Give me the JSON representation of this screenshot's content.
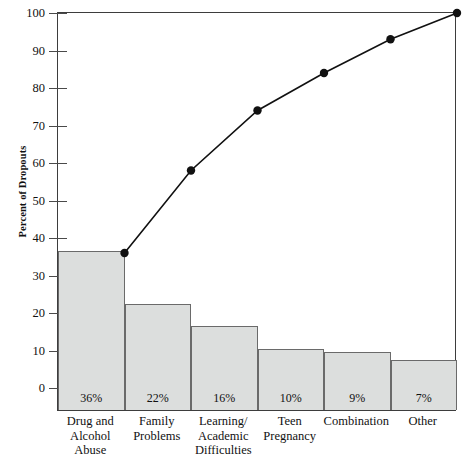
{
  "chart_data": {
    "type": "bar",
    "title": "",
    "xlabel": "",
    "ylabel": "Percent of Dropouts",
    "ylim": [
      0,
      100
    ],
    "yticks": [
      0,
      10,
      20,
      30,
      40,
      50,
      60,
      70,
      80,
      90,
      100
    ],
    "grid": false,
    "legend": "none",
    "categories": [
      "Drug and Alcohol Abuse",
      "Family Problems",
      "Learning/ Academic Difficulties",
      "Teen Pregnancy",
      "Combination",
      "Other"
    ],
    "category_lines": [
      [
        "Drug and",
        "Alcohol",
        "Abuse"
      ],
      [
        "Family",
        "Problems"
      ],
      [
        "Learning/",
        "Academic",
        "Difficulties"
      ],
      [
        "Teen",
        "Pregnancy"
      ],
      [
        "Combination"
      ],
      [
        "Other"
      ]
    ],
    "values": [
      36,
      22,
      16,
      10,
      9,
      7
    ],
    "bar_labels": [
      "36%",
      "22%",
      "16%",
      "10%",
      "9%",
      "7%"
    ],
    "series": [
      {
        "name": "Percent of Dropouts",
        "type": "bar",
        "values": [
          36,
          22,
          16,
          10,
          9,
          7
        ]
      },
      {
        "name": "Cumulative Percent",
        "type": "line",
        "values": [
          36,
          58,
          74,
          84,
          93,
          100
        ]
      }
    ],
    "colors": {
      "bar_fill": "#dcdedd",
      "bar_border": "#6a6a6a",
      "line": "#111111",
      "marker": "#111111",
      "frame": "#3d3d3d",
      "text": "#111111",
      "background": "#ffffff"
    }
  }
}
